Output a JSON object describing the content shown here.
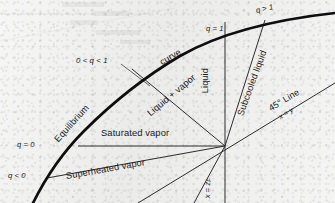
{
  "figure": {
    "background_color": "#ececeb",
    "ink_color": "#17171a"
  },
  "curves": {
    "equilibrium_curve": {
      "name": "equilibrium-curve",
      "label_part1": "Equilibrium",
      "label_part2": "curve",
      "stroke": "#101013",
      "stroke_width": 2.6
    },
    "diagonal": {
      "name": "forty-five-degree-line",
      "label": "45° Line",
      "sub_label_x": "x",
      "sub_label_eq": " = ",
      "sub_label_y": "y",
      "stroke": "#303034",
      "stroke_width": 0.9
    }
  },
  "feed_lines": [
    {
      "key": "q_lt_0",
      "label": "q < 0",
      "region": "Superheated vapor"
    },
    {
      "key": "q_eq_0",
      "label": "q = 0",
      "region": "Saturated vapor"
    },
    {
      "key": "q_0_to_1",
      "label": "0 < q < 1",
      "region": "Liquid + vapor"
    },
    {
      "key": "q_eq_1",
      "label": "q = 1",
      "region": "Liquid"
    },
    {
      "key": "q_gt_1",
      "label": "q > 1",
      "region": "Subcooled liquid"
    }
  ],
  "labels": {
    "q_lt_0": "q < 0",
    "q_eq_0": "q = 0",
    "q_between": "0 < q < 1",
    "q_eq_1": "q = 1",
    "q_gt_1": "q > 1",
    "equilibrium": "Equilibrium",
    "curve": "curve",
    "superheated_vapor": "Superheated vapor",
    "saturated_vapor": "Saturated vapor",
    "liquid_plus_vapor": "Liquid + vapor",
    "liquid": "Liquid",
    "subcooled_liquid": "Subcooled liquid",
    "forty_five_line": "45° Line",
    "x_equals_y_x": "x",
    "x_equals_y_eq": " = ",
    "x_equals_y_y": "y",
    "feed_comp_x": "x",
    "feed_comp_eq": " = ",
    "feed_comp_z": "z",
    "feed_comp_sub": "F"
  },
  "geometry": {
    "intersection_point": {
      "x": 225,
      "y": 146
    },
    "note": "All q-lines radiate from the feed point on the 45° diagonal"
  }
}
